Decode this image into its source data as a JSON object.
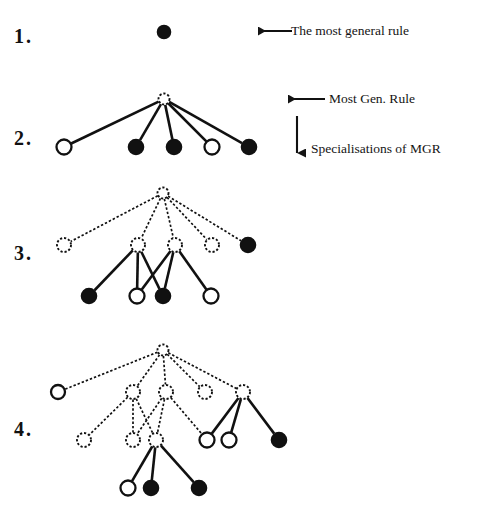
{
  "figure": {
    "kind": "diagram",
    "title": "",
    "background_color": "#ffffff",
    "stroke_color": "#111111",
    "node_fill_filled": "#111111",
    "node_fill_open": "#ffffff"
  },
  "steps": [
    {
      "id": "step-1",
      "label": "1."
    },
    {
      "id": "step-2",
      "label": "2."
    },
    {
      "id": "step-3",
      "label": "3."
    },
    {
      "id": "step-4",
      "label": "4."
    }
  ],
  "annotations": [
    {
      "id": "anno-most-general-rule",
      "text": "The most general rule",
      "arrow": "left-arrow"
    },
    {
      "id": "anno-most-gen-rule",
      "text": "Most Gen. Rule",
      "arrow": "left-arrow"
    },
    {
      "id": "anno-specialisations",
      "text": "Specialisations of MGR",
      "arrow": "down-arrow"
    }
  ],
  "panels": [
    {
      "id": "panel-1",
      "step": "1.",
      "nodes": [
        {
          "id": "p1-root",
          "x": 164,
          "y": 32,
          "r": 6.5,
          "style": "filled"
        }
      ],
      "edges": []
    },
    {
      "id": "panel-2",
      "step": "2.",
      "nodes": [
        {
          "id": "p2-root",
          "x": 164,
          "y": 99,
          "r": 5.5,
          "style": "dashed"
        },
        {
          "id": "p2-c1",
          "x": 64,
          "y": 147,
          "r": 7.5,
          "style": "open"
        },
        {
          "id": "p2-c2",
          "x": 136,
          "y": 147,
          "r": 7.5,
          "style": "filled"
        },
        {
          "id": "p2-c3",
          "x": 174,
          "y": 147,
          "r": 7.5,
          "style": "filled"
        },
        {
          "id": "p2-c4",
          "x": 212,
          "y": 147,
          "r": 7.5,
          "style": "open"
        },
        {
          "id": "p2-c5",
          "x": 249,
          "y": 147,
          "r": 7.5,
          "style": "filled"
        }
      ],
      "edges": [
        {
          "from": "p2-root",
          "to": "p2-c1",
          "style": "solid"
        },
        {
          "from": "p2-root",
          "to": "p2-c2",
          "style": "solid"
        },
        {
          "from": "p2-root",
          "to": "p2-c3",
          "style": "solid"
        },
        {
          "from": "p2-root",
          "to": "p2-c4",
          "style": "solid"
        },
        {
          "from": "p2-root",
          "to": "p2-c5",
          "style": "solid"
        }
      ]
    },
    {
      "id": "panel-3",
      "step": "3.",
      "nodes": [
        {
          "id": "p3-root",
          "x": 163,
          "y": 193,
          "r": 5.5,
          "style": "dashed"
        },
        {
          "id": "p3-a1",
          "x": 64,
          "y": 245,
          "r": 7,
          "style": "dashed"
        },
        {
          "id": "p3-a2",
          "x": 138,
          "y": 245,
          "r": 7,
          "style": "dashed"
        },
        {
          "id": "p3-a3",
          "x": 175,
          "y": 245,
          "r": 7,
          "style": "dashed"
        },
        {
          "id": "p3-a4",
          "x": 212,
          "y": 245,
          "r": 7,
          "style": "dashed"
        },
        {
          "id": "p3-a5",
          "x": 248,
          "y": 245,
          "r": 7.5,
          "style": "filled"
        },
        {
          "id": "p3-b1",
          "x": 89,
          "y": 296,
          "r": 7.5,
          "style": "filled"
        },
        {
          "id": "p3-b2",
          "x": 137,
          "y": 296,
          "r": 7.5,
          "style": "open"
        },
        {
          "id": "p3-b3",
          "x": 163,
          "y": 296,
          "r": 7.5,
          "style": "filled"
        },
        {
          "id": "p3-b4",
          "x": 211,
          "y": 296,
          "r": 7.5,
          "style": "open"
        }
      ],
      "edges": [
        {
          "from": "p3-root",
          "to": "p3-a1",
          "style": "dashed"
        },
        {
          "from": "p3-root",
          "to": "p3-a2",
          "style": "dashed"
        },
        {
          "from": "p3-root",
          "to": "p3-a3",
          "style": "dashed"
        },
        {
          "from": "p3-root",
          "to": "p3-a4",
          "style": "dashed"
        },
        {
          "from": "p3-root",
          "to": "p3-a5",
          "style": "dashed"
        },
        {
          "from": "p3-a2",
          "to": "p3-b1",
          "style": "solid"
        },
        {
          "from": "p3-a2",
          "to": "p3-b2",
          "style": "solid"
        },
        {
          "from": "p3-a2",
          "to": "p3-b3",
          "style": "solid"
        },
        {
          "from": "p3-a3",
          "to": "p3-b2",
          "style": "solid"
        },
        {
          "from": "p3-a3",
          "to": "p3-b3",
          "style": "solid"
        },
        {
          "from": "p3-a3",
          "to": "p3-b4",
          "style": "solid"
        }
      ]
    },
    {
      "id": "panel-4",
      "step": "4.",
      "nodes": [
        {
          "id": "p4-root",
          "x": 163,
          "y": 350,
          "r": 5.5,
          "style": "dashed"
        },
        {
          "id": "p4-a1",
          "x": 58,
          "y": 392,
          "r": 7,
          "style": "open"
        },
        {
          "id": "p4-a2",
          "x": 133,
          "y": 392,
          "r": 7,
          "style": "dashed"
        },
        {
          "id": "p4-a3",
          "x": 166,
          "y": 392,
          "r": 7,
          "style": "dashed"
        },
        {
          "id": "p4-a4",
          "x": 205,
          "y": 392,
          "r": 7,
          "style": "dashed"
        },
        {
          "id": "p4-a5",
          "x": 243,
          "y": 392,
          "r": 7,
          "style": "dashed"
        },
        {
          "id": "p4-b1",
          "x": 84,
          "y": 440,
          "r": 7,
          "style": "dashed"
        },
        {
          "id": "p4-b2",
          "x": 133,
          "y": 440,
          "r": 7,
          "style": "dashed"
        },
        {
          "id": "p4-b3",
          "x": 156,
          "y": 440,
          "r": 7,
          "style": "dashed"
        },
        {
          "id": "p4-b4",
          "x": 207,
          "y": 440,
          "r": 7.5,
          "style": "open"
        },
        {
          "id": "p4-b5",
          "x": 229,
          "y": 440,
          "r": 7.5,
          "style": "open"
        },
        {
          "id": "p4-b6",
          "x": 279,
          "y": 440,
          "r": 7.5,
          "style": "filled"
        },
        {
          "id": "p4-c1",
          "x": 128,
          "y": 488,
          "r": 7.5,
          "style": "open"
        },
        {
          "id": "p4-c2",
          "x": 151,
          "y": 488,
          "r": 7.5,
          "style": "filled"
        },
        {
          "id": "p4-c3",
          "x": 199,
          "y": 488,
          "r": 7.5,
          "style": "filled"
        }
      ],
      "edges": [
        {
          "from": "p4-root",
          "to": "p4-a1",
          "style": "dashed"
        },
        {
          "from": "p4-root",
          "to": "p4-a2",
          "style": "dashed"
        },
        {
          "from": "p4-root",
          "to": "p4-a3",
          "style": "dashed"
        },
        {
          "from": "p4-root",
          "to": "p4-a4",
          "style": "dashed"
        },
        {
          "from": "p4-root",
          "to": "p4-a5",
          "style": "dashed"
        },
        {
          "from": "p4-a2",
          "to": "p4-b1",
          "style": "dashed"
        },
        {
          "from": "p4-a2",
          "to": "p4-b2",
          "style": "dashed"
        },
        {
          "from": "p4-a2",
          "to": "p4-b3",
          "style": "dashed"
        },
        {
          "from": "p4-a3",
          "to": "p4-b2",
          "style": "dashed"
        },
        {
          "from": "p4-a3",
          "to": "p4-b3",
          "style": "dashed"
        },
        {
          "from": "p4-a3",
          "to": "p4-b4",
          "style": "dashed"
        },
        {
          "from": "p4-a5",
          "to": "p4-b4",
          "style": "solid"
        },
        {
          "from": "p4-a5",
          "to": "p4-b5",
          "style": "solid"
        },
        {
          "from": "p4-a5",
          "to": "p4-b6",
          "style": "solid"
        },
        {
          "from": "p4-b3",
          "to": "p4-c1",
          "style": "solid"
        },
        {
          "from": "p4-b3",
          "to": "p4-c2",
          "style": "solid"
        },
        {
          "from": "p4-b3",
          "to": "p4-c3",
          "style": "solid"
        }
      ]
    }
  ],
  "layout": {
    "step_label_positions": [
      {
        "id": "step-1",
        "x": 14,
        "y": 26
      },
      {
        "id": "step-2",
        "x": 14,
        "y": 128
      },
      {
        "id": "step-3",
        "x": 14,
        "y": 243
      },
      {
        "id": "step-4",
        "x": 14,
        "y": 419
      }
    ],
    "annotation_positions": [
      {
        "id": "anno-most-general-rule",
        "arrow_x1": 292,
        "arrow_x2": 258,
        "arrow_y": 31,
        "text_x": 292,
        "text_y": 25
      },
      {
        "id": "anno-most-gen-rule",
        "arrow_x1": 325,
        "arrow_x2": 288,
        "arrow_y": 99,
        "text_x": 330,
        "text_y": 92
      },
      {
        "id": "anno-specialisations",
        "arrow_y1": 116,
        "arrow_y2": 153,
        "arrow_x": 297,
        "text_x": 311,
        "text_y": 141
      }
    ]
  }
}
